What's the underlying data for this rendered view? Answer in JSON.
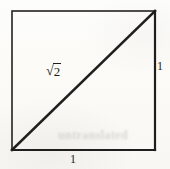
{
  "figure": {
    "background_color": "#fcfbf8",
    "stroke_color": "#262421",
    "square": {
      "x": 12,
      "y": 11,
      "width": 143,
      "height": 139,
      "stroke_width": 1.6
    },
    "diagonal": {
      "x1": 12,
      "y1": 150,
      "x2": 155,
      "y2": 11,
      "stroke_width": 2.6
    },
    "labels": {
      "hypotenuse_radical": "√",
      "hypotenuse_radicand": "2",
      "hypotenuse_full": "√2",
      "side_right": "1",
      "side_bottom": "1"
    },
    "watermark_text": "untranslated"
  }
}
